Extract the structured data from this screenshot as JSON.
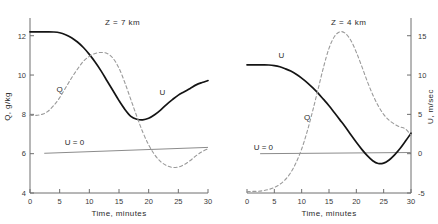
{
  "figure": {
    "background": "#ffffff",
    "solid_color": "#141414",
    "dashed_color": "#9a9a9a",
    "axis_color": "#6e6e6e"
  },
  "chart_data": [
    {
      "type": "line",
      "title": "Z = 7 km",
      "panel": "left",
      "xlabel": "Time, minutes",
      "ylabel": "Q, g/kg",
      "xlim": [
        0,
        30
      ],
      "ylim": [
        4,
        12.8
      ],
      "xticks": [
        0,
        5,
        10,
        15,
        20,
        25,
        30
      ],
      "xticklabels": [
        "0",
        "5",
        "10",
        "15",
        "20",
        "25",
        "30"
      ],
      "yticks": [
        4,
        6,
        8,
        10,
        12
      ],
      "yticklabels": [
        "4",
        "6",
        "8",
        "10",
        "12"
      ],
      "grid": false,
      "legend": "inline-curve-labels",
      "annotations": [
        {
          "text": "U = 0",
          "x": 7.5,
          "y": 6.45
        },
        {
          "text": "Q",
          "x": 5.0,
          "y": 9.15
        },
        {
          "text": "U",
          "x": 22.3,
          "y": 9.0
        }
      ],
      "reference_line": {
        "label": "U = 0",
        "y_start": 6.02,
        "y_end": 6.32
      },
      "series": [
        {
          "name": "U",
          "style": "solid",
          "axis": "right",
          "x": [
            0,
            1,
            2,
            3,
            4,
            5,
            6,
            7,
            8,
            9,
            10,
            11,
            12,
            13,
            14,
            15,
            16,
            17,
            18,
            19,
            20,
            21,
            22,
            23,
            24,
            25,
            26,
            27,
            28,
            29,
            30
          ],
          "values": [
            12.2,
            12.2,
            12.2,
            12.2,
            12.19,
            12.15,
            12.05,
            11.9,
            11.68,
            11.4,
            11.05,
            10.65,
            10.2,
            9.7,
            9.2,
            8.7,
            8.25,
            7.9,
            7.75,
            7.72,
            7.8,
            7.98,
            8.22,
            8.5,
            8.75,
            8.98,
            9.15,
            9.32,
            9.5,
            9.62,
            9.72
          ]
        },
        {
          "name": "Q",
          "style": "dashed",
          "axis": "left",
          "x": [
            0,
            1,
            2,
            3,
            4,
            5,
            6,
            7,
            8,
            9,
            10,
            11,
            12,
            13,
            14,
            15,
            16,
            17,
            18,
            19,
            20,
            21,
            22,
            23,
            24,
            25,
            26,
            27,
            28,
            29,
            30
          ],
          "values": [
            7.95,
            7.95,
            8.0,
            8.15,
            8.45,
            8.85,
            9.35,
            9.85,
            10.3,
            10.7,
            10.95,
            11.1,
            11.15,
            11.1,
            10.85,
            10.35,
            9.6,
            8.75,
            7.9,
            7.1,
            6.45,
            5.95,
            5.6,
            5.4,
            5.3,
            5.32,
            5.45,
            5.65,
            5.9,
            6.1,
            6.25
          ]
        }
      ]
    },
    {
      "type": "line",
      "title": "Z = 4 km",
      "panel": "right",
      "xlabel": "Time, minutes",
      "ylabel": "U, m/sec",
      "xlim": [
        0,
        30
      ],
      "ylim": [
        -5,
        17
      ],
      "xticks": [
        0,
        5,
        10,
        15,
        20,
        25,
        30
      ],
      "xticklabels": [
        "0",
        "5",
        "10",
        "15",
        "20",
        "25",
        "30"
      ],
      "yticks": [
        -5,
        0,
        5,
        10,
        15
      ],
      "yticklabels": [
        "-5",
        "0",
        "5",
        "10",
        "15"
      ],
      "grid": false,
      "legend": "inline-curve-labels",
      "annotations": [
        {
          "text": "U = 0",
          "x": 3.0,
          "y": 0.45
        },
        {
          "text": "U",
          "x": 6.3,
          "y": 12.2
        },
        {
          "text": "Q",
          "x": 11.0,
          "y": 4.3
        }
      ],
      "reference_line": {
        "label": "U = 0",
        "y_start": 0.0,
        "y_end": 0.15
      },
      "series": [
        {
          "name": "U",
          "style": "solid",
          "axis": "right",
          "x": [
            0,
            1,
            2,
            3,
            4,
            5,
            6,
            7,
            8,
            9,
            10,
            11,
            12,
            13,
            14,
            15,
            16,
            17,
            18,
            19,
            20,
            21,
            22,
            23,
            24,
            25,
            26,
            27,
            28,
            29,
            30
          ],
          "values": [
            11.3,
            11.3,
            11.3,
            11.3,
            11.28,
            11.2,
            11.05,
            10.8,
            10.5,
            10.1,
            9.6,
            9.05,
            8.4,
            7.7,
            6.9,
            6.1,
            5.2,
            4.3,
            3.4,
            2.4,
            1.45,
            0.55,
            -0.25,
            -0.9,
            -1.25,
            -1.2,
            -0.8,
            -0.15,
            0.65,
            1.6,
            2.6
          ]
        },
        {
          "name": "Q",
          "style": "dashed",
          "axis": "left",
          "x": [
            0,
            1,
            2,
            3,
            4,
            5,
            6,
            7,
            8,
            9,
            10,
            11,
            12,
            13,
            14,
            15,
            16,
            17,
            18,
            19,
            20,
            21,
            22,
            23,
            24,
            25,
            26,
            27,
            28,
            29,
            30
          ],
          "values": [
            -4.8,
            -4.8,
            -4.78,
            -4.7,
            -4.55,
            -4.3,
            -3.9,
            -3.3,
            -2.4,
            -1.1,
            0.6,
            2.8,
            5.4,
            8.2,
            11.0,
            13.4,
            14.9,
            15.5,
            15.3,
            14.4,
            12.9,
            11.1,
            9.2,
            7.5,
            6.1,
            5.0,
            4.25,
            3.75,
            3.4,
            3.15,
            2.35
          ]
        }
      ]
    }
  ]
}
